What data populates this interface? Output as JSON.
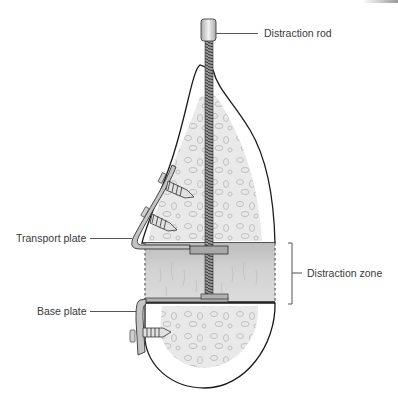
{
  "figure": {
    "type": "medical illustration",
    "labels": {
      "distraction_rod": "Distraction rod",
      "transport_plate": "Transport plate",
      "distraction_zone": "Distraction zone",
      "base_plate": "Base plate"
    },
    "colors": {
      "outline": "#1a1a1a",
      "bone_fill": "#ffffff",
      "cancellous_fill": "#e6e6e6",
      "distraction_zone_fill": "#cfcfcf",
      "metal": "#bdbdbd",
      "label_text": "#3a3a3a"
    }
  }
}
